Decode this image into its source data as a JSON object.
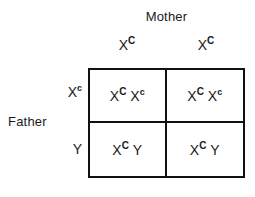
{
  "figure": {
    "type": "punnett-square",
    "title_top": "Mother",
    "title_left": "Father"
  },
  "mother": {
    "label": "Mother",
    "gametes": [
      {
        "base": "X",
        "sup": "C",
        "sup_case": "upper"
      },
      {
        "base": "X",
        "sup": "C",
        "sup_case": "upper"
      }
    ]
  },
  "father": {
    "label": "Father",
    "gametes": [
      {
        "base": "X",
        "sup": "c",
        "sup_case": "lower"
      },
      {
        "base": "Y",
        "sup": "",
        "sup_case": "none"
      }
    ]
  },
  "grid": {
    "rows": 2,
    "cols": 2,
    "cells": [
      {
        "row": 0,
        "col": 0,
        "alleles": [
          {
            "base": "X",
            "sup": "C",
            "sup_case": "upper"
          },
          {
            "base": "X",
            "sup": "c",
            "sup_case": "lower"
          }
        ]
      },
      {
        "row": 0,
        "col": 1,
        "alleles": [
          {
            "base": "X",
            "sup": "C",
            "sup_case": "upper"
          },
          {
            "base": "X",
            "sup": "c",
            "sup_case": "lower"
          }
        ]
      },
      {
        "row": 1,
        "col": 0,
        "alleles": [
          {
            "base": "X",
            "sup": "C",
            "sup_case": "upper"
          },
          {
            "base": "Y",
            "sup": "",
            "sup_case": "none"
          }
        ]
      },
      {
        "row": 1,
        "col": 1,
        "alleles": [
          {
            "base": "X",
            "sup": "C",
            "sup_case": "upper"
          },
          {
            "base": "Y",
            "sup": "",
            "sup_case": "none"
          }
        ]
      }
    ]
  },
  "colors": {
    "ink": "#111111",
    "text": "#1a1a1a",
    "background": "#ffffff"
  }
}
